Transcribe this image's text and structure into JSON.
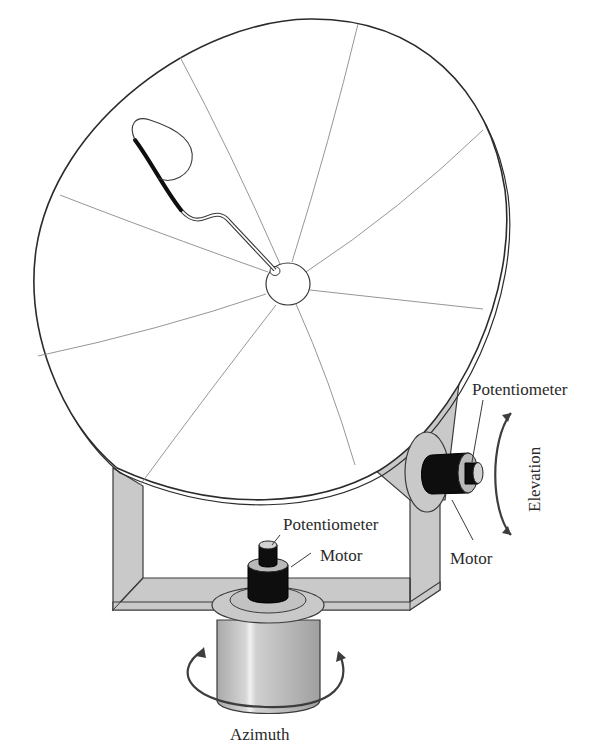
{
  "diagram": {
    "labels": {
      "elevation_potentiometer": "Potentiometer",
      "elevation_motor": "Motor",
      "elevation_axis": "Elevation",
      "azimuth_potentiometer": "Potentiometer",
      "azimuth_motor": "Motor",
      "azimuth_axis": "Azimuth"
    },
    "components": [
      {
        "name": "Parabolic dish reflector"
      },
      {
        "name": "Feed horn arm"
      },
      {
        "name": "Dish hub"
      },
      {
        "name": "Yoke frame"
      },
      {
        "name": "Elevation motor"
      },
      {
        "name": "Elevation potentiometer"
      },
      {
        "name": "Azimuth motor"
      },
      {
        "name": "Azimuth potentiometer"
      },
      {
        "name": "Azimuth base pedestal"
      }
    ],
    "colors": {
      "metal": "#c9c9c9",
      "motor": "#0e0e0e",
      "outline": "#2b2b2b"
    }
  }
}
